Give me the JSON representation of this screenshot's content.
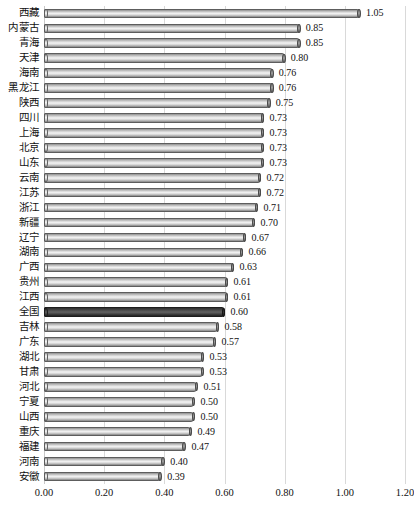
{
  "chart_data": {
    "type": "bar",
    "orientation": "horizontal",
    "title": "",
    "subtitle": "",
    "xlabel": "",
    "ylabel": "",
    "xlim": [
      0.0,
      1.2
    ],
    "xticks": [
      "0.00",
      "0.20",
      "0.40",
      "0.60",
      "0.80",
      "1.00",
      "1.20"
    ],
    "xtick_values": [
      0.0,
      0.2,
      0.4,
      0.6,
      0.8,
      1.0,
      1.2
    ],
    "grid": "vertical",
    "legend": "none",
    "highlight_category": "全国",
    "highlight_color": "#2e2e2e",
    "bar_color": "#d0d0d0",
    "categories": [
      "西藏",
      "内蒙古",
      "青海",
      "天津",
      "海南",
      "黑龙江",
      "陕西",
      "四川",
      "上海",
      "北京",
      "山东",
      "云南",
      "江苏",
      "浙江",
      "新疆",
      "辽宁",
      "湖南",
      "广西",
      "贵州",
      "江西",
      "全国",
      "吉林",
      "广东",
      "湖北",
      "甘肃",
      "河北",
      "宁夏",
      "山西",
      "重庆",
      "福建",
      "河南",
      "安徽"
    ],
    "values": [
      1.05,
      0.85,
      0.85,
      0.8,
      0.76,
      0.76,
      0.75,
      0.73,
      0.73,
      0.73,
      0.73,
      0.72,
      0.72,
      0.71,
      0.7,
      0.67,
      0.66,
      0.63,
      0.61,
      0.61,
      0.6,
      0.58,
      0.57,
      0.53,
      0.53,
      0.51,
      0.5,
      0.5,
      0.49,
      0.47,
      0.4,
      0.39
    ],
    "value_labels": [
      "1.05",
      "0.85",
      "0.85",
      "0.80",
      "0.76",
      "0.76",
      "0.75",
      "0.73",
      "0.73",
      "0.73",
      "0.73",
      "0.72",
      "0.72",
      "0.71",
      "0.70",
      "0.67",
      "0.66",
      "0.63",
      "0.61",
      "0.61",
      "0.60",
      "0.58",
      "0.57",
      "0.53",
      "0.53",
      "0.51",
      "0.50",
      "0.50",
      "0.49",
      "0.47",
      "0.40",
      "0.39"
    ]
  }
}
